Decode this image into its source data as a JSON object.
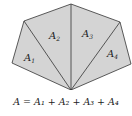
{
  "diagram": {
    "regions": [
      {
        "label": "A",
        "sub": "1"
      },
      {
        "label": "A",
        "sub": "2"
      },
      {
        "label": "A",
        "sub": "3"
      },
      {
        "label": "A",
        "sub": "4"
      }
    ],
    "fill_color": "#d4d4d4",
    "stroke_color": "#333333"
  },
  "formula": "A = A₁ + A₂ + A₃ + A₄"
}
